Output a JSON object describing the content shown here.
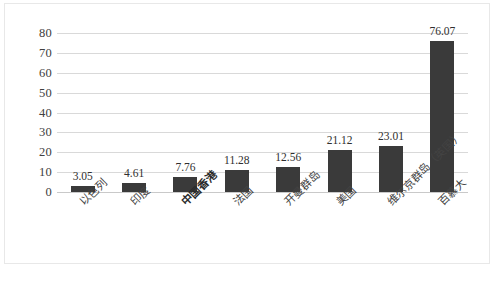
{
  "chart_data": {
    "type": "bar",
    "title": "",
    "subtitle": "",
    "xlabel": "",
    "ylabel": "",
    "ylim": [
      0,
      80
    ],
    "ytick_step": 10,
    "yticks": [
      "80",
      "70",
      "60",
      "50",
      "40",
      "30",
      "20",
      "10",
      "0"
    ],
    "grid": true,
    "legend": false,
    "legend_position": "none",
    "bar_color": "#3a3a3a",
    "gridline_color": "#d9d9d9",
    "categories": [
      "以色列",
      "印度",
      "中国香港",
      "法国",
      "开曼群岛",
      "美国",
      "维尔京群岛（英国）",
      "百慕大"
    ],
    "category_emphasis": [
      false,
      false,
      true,
      false,
      false,
      false,
      false,
      false
    ],
    "values": [
      3.05,
      4.61,
      7.76,
      11.28,
      12.56,
      21.12,
      23.01,
      76.07
    ],
    "value_labels": [
      "3.05",
      "4.61",
      "7.76",
      "11.28",
      "12.56",
      "21.12",
      "23.01",
      "76.07"
    ]
  }
}
